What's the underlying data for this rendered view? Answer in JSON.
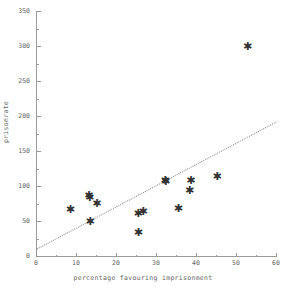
{
  "chart_data": {
    "type": "scatter",
    "title": "",
    "xlabel": "percentage favouring imprisonment",
    "ylabel": "prisonrate",
    "xlim": [
      0,
      60
    ],
    "ylim": [
      0,
      350
    ],
    "xticks": [
      0,
      10,
      20,
      30,
      40,
      50,
      60
    ],
    "xtick_labels": [
      "0",
      "10",
      "20",
      "30",
      "40",
      "50",
      "60"
    ],
    "yticks": [
      0,
      50,
      100,
      150,
      200,
      250,
      300,
      350
    ],
    "ytick_labels": [
      "0",
      "50",
      "100",
      "150",
      "200",
      "250",
      "300",
      "350"
    ],
    "grid": false,
    "legend": null,
    "marker": "asterisk",
    "points": [
      {
        "x": 8.6,
        "y": 66
      },
      {
        "x": 13.2,
        "y": 86
      },
      {
        "x": 13.4,
        "y": 84
      },
      {
        "x": 13.5,
        "y": 49
      },
      {
        "x": 15.2,
        "y": 75
      },
      {
        "x": 25.5,
        "y": 61
      },
      {
        "x": 25.6,
        "y": 34
      },
      {
        "x": 26.8,
        "y": 63
      },
      {
        "x": 32.3,
        "y": 108
      },
      {
        "x": 32.4,
        "y": 106
      },
      {
        "x": 35.6,
        "y": 68
      },
      {
        "x": 38.4,
        "y": 93
      },
      {
        "x": 38.7,
        "y": 108
      },
      {
        "x": 45.3,
        "y": 114
      },
      {
        "x": 52.9,
        "y": 299
      }
    ],
    "fit_line": {
      "type": "dotted-regression",
      "x_start": 0,
      "y_start": 10,
      "x_end": 60,
      "y_end": 192
    }
  }
}
